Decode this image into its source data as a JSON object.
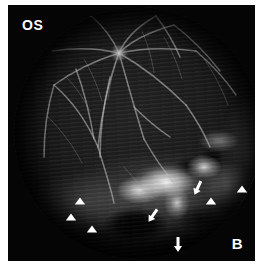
{
  "figure": {
    "panel_label": "B",
    "eye_label": "OS",
    "modality": "fundus-fluorescein-angiogram",
    "width_px": 262,
    "height_px": 266,
    "background_color": "#ffffff",
    "plate_color": "#050505",
    "marker_color": "#ffffff"
  },
  "anatomy": {
    "optic_disc": {
      "cx": 105,
      "cy": 45,
      "r": 9
    },
    "fundus_field": {
      "cx": 130,
      "cy": 130,
      "rx": 124,
      "ry": 126
    }
  },
  "annotations": {
    "arrowheads": [
      {
        "id": "arrowhead-1",
        "x": 72,
        "y": 196,
        "rotation": 0,
        "region": "inferior-nasal"
      },
      {
        "id": "arrowhead-2",
        "x": 63,
        "y": 212,
        "rotation": 0,
        "region": "inferior-nasal"
      },
      {
        "id": "arrowhead-3",
        "x": 84,
        "y": 224,
        "rotation": 0,
        "region": "inferior-nasal"
      },
      {
        "id": "arrowhead-4",
        "x": 203,
        "y": 196,
        "rotation": 0,
        "region": "inferior-temporal"
      },
      {
        "id": "arrowhead-5",
        "x": 234,
        "y": 184,
        "rotation": 0,
        "region": "temporal"
      }
    ],
    "arrows": [
      {
        "id": "arrow-1",
        "x": 148,
        "y": 206,
        "rotation": 215,
        "region": "inferior-central"
      },
      {
        "id": "arrow-2",
        "x": 170,
        "y": 234,
        "rotation": 180,
        "region": "inferior-central"
      },
      {
        "id": "arrow-3",
        "x": 192,
        "y": 178,
        "rotation": 205,
        "region": "inferior-temporal"
      }
    ],
    "arrowhead_count": 5,
    "arrow_count": 3
  },
  "vessels": {
    "stroke_color": "#b9b9b9",
    "paths": [
      "M105,46 C112,30 126,18 142,9",
      "M105,46 C118,33 138,24 160,18",
      "M105,46 C124,42 152,40 182,44",
      "M105,46 C126,58 150,76 172,98",
      "M105,46 C112,70 120,100 130,132",
      "M105,46 C96,70 88,104 84,140",
      "M105,46 C86,52 62,62 40,78",
      "M105,46 C88,42 64,40 38,44",
      "M105,46 C98,30 88,18 76,8",
      "M40,78 C56,92 72,112 84,140",
      "M40,78 C34,98 30,124 30,150",
      "M84,140 C90,160 96,178 100,196",
      "M130,132 C140,150 150,164 160,176",
      "M172,98 C182,112 190,126 196,140",
      "M160,18 C176,30 192,46 206,64",
      "M182,44 C196,56 210,70 222,88",
      "M62,62 C70,84 76,108 80,132",
      "M120,100 C132,112 144,122 156,130",
      "M142,9 C152,22 160,36 166,50",
      "M96,70 C90,96 86,124 86,150"
    ],
    "thin_paths": [
      "M105,46 C100,60 96,76 94,92",
      "M52,70 C62,80 70,92 76,104",
      "M150,30 C158,44 164,58 168,72",
      "M190,52 C200,66 208,82 214,98",
      "M70,52 C78,66 84,80 88,94",
      "M34,110 C48,124 60,140 68,156",
      "M128,24 C134,38 138,52 140,66",
      "M110,160 C120,172 130,182 138,190"
    ]
  }
}
